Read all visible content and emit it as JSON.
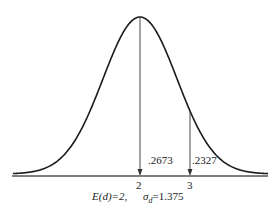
{
  "chart_data": {
    "type": "line",
    "title": "",
    "xlabel": "",
    "ylabel": "",
    "mean": 2,
    "std_dev": 1.375,
    "x_ticks": [
      "2",
      "3"
    ],
    "annotations": [
      {
        "text": ".2673",
        "region": "between 2 and 3"
      },
      {
        "text": ".2327",
        "region": "right of 3"
      }
    ],
    "caption_parts": {
      "mean_label": "E(d) = 2,",
      "sd_label": "σd = 1.375"
    },
    "grid": false,
    "legend": null
  },
  "labels": {
    "tick_2": "2",
    "tick_3": "3",
    "area_mid": ".2673",
    "area_tail": ".2327",
    "mean_text": "E(d)=2,",
    "sd_sigma": "σ",
    "sd_sub": "d",
    "sd_value": "=1.375"
  },
  "colors": {
    "curve": "#1a1a1a",
    "axis": "#555555",
    "text": "#222222"
  }
}
